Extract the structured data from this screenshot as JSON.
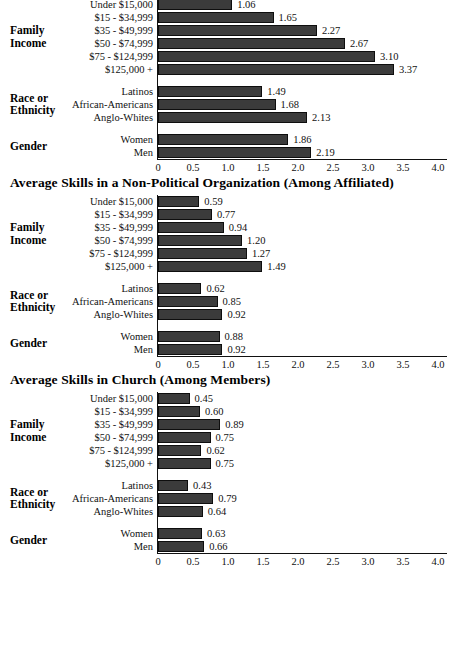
{
  "page": {
    "background": "#ffffff",
    "bar_color": "#3b3b3b",
    "axis_color": "#111111"
  },
  "axis": {
    "min": 0,
    "max": 4.0,
    "ticks": [
      "0",
      "0.5",
      "1.0",
      "1.5",
      "2.0",
      "2.5",
      "3.0",
      "3.5",
      "4.0"
    ],
    "tick_values": [
      0,
      0.5,
      1.0,
      1.5,
      2.0,
      2.5,
      3.0,
      3.5,
      4.0
    ]
  },
  "groups": {
    "income": "Family\nIncome",
    "income_line1": "Family",
    "income_line2": "Income",
    "race_line1": "Race or",
    "race_line2": "Ethnicity",
    "gender": "Gender"
  },
  "charts": [
    {
      "title": "",
      "title_visible": false,
      "groups": [
        {
          "name": "Family Income",
          "categories": [
            "Under $15,000",
            "$15 - $34,999",
            "$35 - $49,999",
            "$50 - $74,999",
            "$75 - $124,999",
            "$125,000 +"
          ],
          "values": [
            1.06,
            1.65,
            2.27,
            2.67,
            3.1,
            3.37
          ],
          "labels": [
            "1.06",
            "1.65",
            "2.27",
            "2.67",
            "3.10",
            "3.37"
          ]
        },
        {
          "name": "Race or Ethnicity",
          "categories": [
            "Latinos",
            "African-Americans",
            "Anglo-Whites"
          ],
          "values": [
            1.49,
            1.68,
            2.13
          ],
          "labels": [
            "1.49",
            "1.68",
            "2.13"
          ]
        },
        {
          "name": "Gender",
          "categories": [
            "Women",
            "Men"
          ],
          "values": [
            1.86,
            2.19
          ],
          "labels": [
            "1.86",
            "2.19"
          ]
        }
      ]
    },
    {
      "title": "Average Skills in a Non-Political Organization (Among Affiliated)",
      "title_visible": true,
      "groups": [
        {
          "name": "Family Income",
          "categories": [
            "Under $15,000",
            "$15 - $34,999",
            "$35 - $49,999",
            "$50 - $74,999",
            "$75 - $124,999",
            "$125,000 +"
          ],
          "values": [
            0.59,
            0.77,
            0.94,
            1.2,
            1.27,
            1.49
          ],
          "labels": [
            "0.59",
            "0.77",
            "0.94",
            "1.20",
            "1.27",
            "1.49"
          ]
        },
        {
          "name": "Race or Ethnicity",
          "categories": [
            "Latinos",
            "African-Americans",
            "Anglo-Whites"
          ],
          "values": [
            0.62,
            0.85,
            0.92
          ],
          "labels": [
            "0.62",
            "0.85",
            "0.92"
          ]
        },
        {
          "name": "Gender",
          "categories": [
            "Women",
            "Men"
          ],
          "values": [
            0.88,
            0.92
          ],
          "labels": [
            "0.88",
            "0.92"
          ]
        }
      ]
    },
    {
      "title": "Average Skills in Church (Among Members)",
      "title_visible": true,
      "groups": [
        {
          "name": "Family Income",
          "categories": [
            "Under $15,000",
            "$15 - $34,999",
            "$35 - $49,999",
            "$50 - $74,999",
            "$75 - $124,999",
            "$125,000 +"
          ],
          "values": [
            0.45,
            0.6,
            0.89,
            0.75,
            0.62,
            0.75
          ],
          "labels": [
            "0.45",
            "0.60",
            "0.89",
            "0.75",
            "0.62",
            "0.75"
          ]
        },
        {
          "name": "Race or Ethnicity",
          "categories": [
            "Latinos",
            "African-Americans",
            "Anglo-Whites"
          ],
          "values": [
            0.43,
            0.79,
            0.64
          ],
          "labels": [
            "0.43",
            "0.79",
            "0.64"
          ]
        },
        {
          "name": "Gender",
          "categories": [
            "Women",
            "Men"
          ],
          "values": [
            0.63,
            0.66
          ],
          "labels": [
            "0.63",
            "0.66"
          ]
        }
      ]
    }
  ],
  "chart_data": [
    {
      "type": "bar",
      "orientation": "horizontal",
      "title": "",
      "xlabel": "",
      "ylabel": "",
      "xlim": [
        0,
        4.0
      ],
      "grid": false,
      "legend": "none",
      "categories": [
        "Under $15,000",
        "$15 - $34,999",
        "$35 - $49,999",
        "$50 - $74,999",
        "$75 - $124,999",
        "$125,000 +",
        "Latinos",
        "African-Americans",
        "Anglo-Whites",
        "Women",
        "Men"
      ],
      "values": [
        1.06,
        1.65,
        2.27,
        2.67,
        3.1,
        3.37,
        1.49,
        1.68,
        2.13,
        1.86,
        2.19
      ],
      "category_groups": [
        "Family Income",
        "Family Income",
        "Family Income",
        "Family Income",
        "Family Income",
        "Family Income",
        "Race or Ethnicity",
        "Race or Ethnicity",
        "Race or Ethnicity",
        "Gender",
        "Gender"
      ],
      "xticks": [
        0,
        0.5,
        1.0,
        1.5,
        2.0,
        2.5,
        3.0,
        3.5,
        4.0
      ],
      "xticklabels": [
        "0",
        "0.5",
        "1.0",
        "1.5",
        "2.0",
        "2.5",
        "3.0",
        "3.5",
        "4.0"
      ]
    },
    {
      "type": "bar",
      "orientation": "horizontal",
      "title": "Average Skills in a Non-Political Organization (Among Affiliated)",
      "xlabel": "",
      "ylabel": "",
      "xlim": [
        0,
        4.0
      ],
      "grid": false,
      "legend": "none",
      "categories": [
        "Under $15,000",
        "$15 - $34,999",
        "$35 - $49,999",
        "$50 - $74,999",
        "$75 - $124,999",
        "$125,000 +",
        "Latinos",
        "African-Americans",
        "Anglo-Whites",
        "Women",
        "Men"
      ],
      "values": [
        0.59,
        0.77,
        0.94,
        1.2,
        1.27,
        1.49,
        0.62,
        0.85,
        0.92,
        0.88,
        0.92
      ],
      "category_groups": [
        "Family Income",
        "Family Income",
        "Family Income",
        "Family Income",
        "Family Income",
        "Family Income",
        "Race or Ethnicity",
        "Race or Ethnicity",
        "Race or Ethnicity",
        "Gender",
        "Gender"
      ],
      "xticks": [
        0,
        0.5,
        1.0,
        1.5,
        2.0,
        2.5,
        3.0,
        3.5,
        4.0
      ],
      "xticklabels": [
        "0",
        "0.5",
        "1.0",
        "1.5",
        "2.0",
        "2.5",
        "3.0",
        "3.5",
        "4.0"
      ]
    },
    {
      "type": "bar",
      "orientation": "horizontal",
      "title": "Average Skills in Church (Among Members)",
      "xlabel": "",
      "ylabel": "",
      "xlim": [
        0,
        4.0
      ],
      "grid": false,
      "legend": "none",
      "categories": [
        "Under $15,000",
        "$15 - $34,999",
        "$35 - $49,999",
        "$50 - $74,999",
        "$75 - $124,999",
        "$125,000 +",
        "Latinos",
        "African-Americans",
        "Anglo-Whites",
        "Women",
        "Men"
      ],
      "values": [
        0.45,
        0.6,
        0.89,
        0.75,
        0.62,
        0.75,
        0.43,
        0.79,
        0.64,
        0.63,
        0.66
      ],
      "category_groups": [
        "Family Income",
        "Family Income",
        "Family Income",
        "Family Income",
        "Family Income",
        "Family Income",
        "Race or Ethnicity",
        "Race or Ethnicity",
        "Race or Ethnicity",
        "Gender",
        "Gender"
      ],
      "xticks": [
        0,
        0.5,
        1.0,
        1.5,
        2.0,
        2.5,
        3.0,
        3.5,
        4.0
      ],
      "xticklabels": [
        "0",
        "0.5",
        "1.0",
        "1.5",
        "2.0",
        "2.5",
        "3.0",
        "3.5",
        "4.0"
      ]
    }
  ]
}
